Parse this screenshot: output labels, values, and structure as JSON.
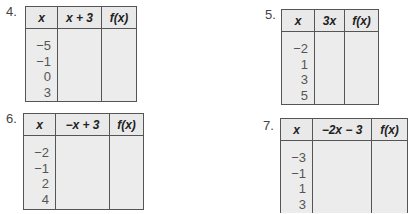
{
  "problems": [
    {
      "number": "4.",
      "headers": [
        "x",
        "x + 3",
        "f(x)"
      ],
      "x_values": [
        "−5",
        "−1",
        "0",
        "3"
      ]
    },
    {
      "number": "5.",
      "headers": [
        "x",
        "3x",
        "f(x)"
      ],
      "x_values": [
        "−2",
        "1",
        "3",
        "5"
      ]
    },
    {
      "number": "6.",
      "headers": [
        "x",
        "−x + 3",
        "f(x)"
      ],
      "x_values": [
        "−2",
        "−1",
        "2",
        "4"
      ]
    },
    {
      "number": "7.",
      "headers": [
        "x",
        "−2x − 3",
        "f(x)"
      ],
      "x_values": [
        "−3",
        "−1",
        "1",
        "3"
      ]
    }
  ]
}
